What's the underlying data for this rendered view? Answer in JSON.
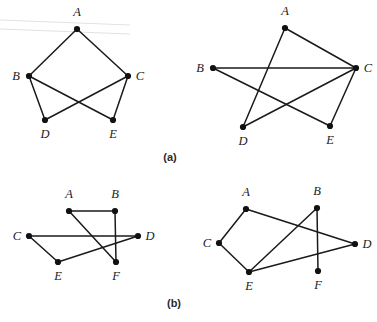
{
  "figure": {
    "background_color": "#ffffff",
    "ink_color": "#1a1a1a",
    "panels": [
      {
        "caption": "(a)",
        "caption_x": 170,
        "caption_y": 161,
        "graphs": [
          {
            "name": "graph-a-left",
            "vertices": [
              {
                "id": "A",
                "label": "A",
                "x": 77,
                "y": 29,
                "label_x": 77,
                "label_y": 16
              },
              {
                "id": "B",
                "label": "B",
                "x": 29,
                "y": 76,
                "label_x": 16,
                "label_y": 80
              },
              {
                "id": "C",
                "label": "C",
                "x": 128,
                "y": 76,
                "label_x": 140,
                "label_y": 80
              },
              {
                "id": "D",
                "label": "D",
                "x": 45,
                "y": 120,
                "label_x": 45,
                "label_y": 138
              },
              {
                "id": "E",
                "label": "E",
                "x": 113,
                "y": 120,
                "label_x": 113,
                "label_y": 138
              }
            ],
            "edges": [
              [
                "A",
                "B"
              ],
              [
                "A",
                "C"
              ],
              [
                "B",
                "D"
              ],
              [
                "B",
                "E"
              ],
              [
                "C",
                "D"
              ],
              [
                "C",
                "E"
              ]
            ]
          },
          {
            "name": "graph-a-right",
            "vertices": [
              {
                "id": "A",
                "label": "A",
                "x": 285,
                "y": 28,
                "label_x": 285,
                "label_y": 15
              },
              {
                "id": "B",
                "label": "B",
                "x": 213,
                "y": 68,
                "label_x": 200,
                "label_y": 72
              },
              {
                "id": "C",
                "label": "C",
                "x": 356,
                "y": 68,
                "label_x": 368,
                "label_y": 72
              },
              {
                "id": "D",
                "label": "D",
                "x": 243,
                "y": 127,
                "label_x": 243,
                "label_y": 145
              },
              {
                "id": "E",
                "label": "E",
                "x": 330,
                "y": 126,
                "label_x": 330,
                "label_y": 144
              }
            ],
            "edges": [
              [
                "A",
                "C"
              ],
              [
                "A",
                "D"
              ],
              [
                "B",
                "C"
              ],
              [
                "B",
                "E"
              ],
              [
                "C",
                "D"
              ],
              [
                "C",
                "E"
              ]
            ]
          }
        ]
      },
      {
        "caption": "(b)",
        "caption_x": 174,
        "caption_y": 307,
        "graphs": [
          {
            "name": "graph-b-left",
            "vertices": [
              {
                "id": "A",
                "label": "A",
                "x": 69,
                "y": 211,
                "label_x": 69,
                "label_y": 198
              },
              {
                "id": "B",
                "label": "B",
                "x": 115,
                "y": 211,
                "label_x": 115,
                "label_y": 198
              },
              {
                "id": "C",
                "label": "C",
                "x": 29,
                "y": 236,
                "label_x": 17,
                "label_y": 240
              },
              {
                "id": "D",
                "label": "D",
                "x": 138,
                "y": 236,
                "label_x": 150,
                "label_y": 240
              },
              {
                "id": "E",
                "label": "E",
                "x": 58,
                "y": 262,
                "label_x": 58,
                "label_y": 280
              },
              {
                "id": "F",
                "label": "F",
                "x": 116,
                "y": 262,
                "label_x": 116,
                "label_y": 280
              }
            ],
            "edges": [
              [
                "A",
                "B"
              ],
              [
                "A",
                "F"
              ],
              [
                "B",
                "F"
              ],
              [
                "C",
                "D"
              ],
              [
                "C",
                "E"
              ],
              [
                "E",
                "D"
              ]
            ]
          },
          {
            "name": "graph-b-right",
            "vertices": [
              {
                "id": "A",
                "label": "A",
                "x": 246,
                "y": 209,
                "label_x": 246,
                "label_y": 196
              },
              {
                "id": "B",
                "label": "B",
                "x": 317,
                "y": 208,
                "label_x": 317,
                "label_y": 195
              },
              {
                "id": "C",
                "label": "C",
                "x": 219,
                "y": 243,
                "label_x": 207,
                "label_y": 247
              },
              {
                "id": "D",
                "label": "D",
                "x": 355,
                "y": 244,
                "label_x": 367,
                "label_y": 248
              },
              {
                "id": "E",
                "label": "E",
                "x": 249,
                "y": 272,
                "label_x": 249,
                "label_y": 290
              },
              {
                "id": "F",
                "label": "F",
                "x": 318,
                "y": 271,
                "label_x": 318,
                "label_y": 289
              }
            ],
            "edges": [
              [
                "A",
                "C"
              ],
              [
                "A",
                "D"
              ],
              [
                "B",
                "E"
              ],
              [
                "B",
                "F"
              ],
              [
                "C",
                "E"
              ],
              [
                "E",
                "D"
              ]
            ]
          }
        ]
      }
    ]
  }
}
